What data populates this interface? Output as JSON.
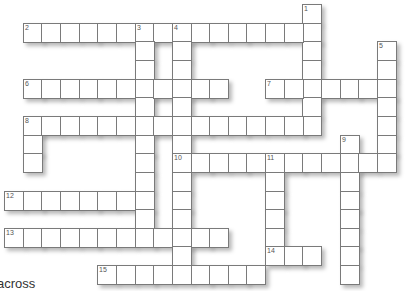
{
  "puzzle": {
    "type": "crossword",
    "heading": "across",
    "words": [
      {
        "number": "1",
        "direction": "down",
        "row": 0,
        "col": 16,
        "length": 7
      },
      {
        "number": "2",
        "direction": "across",
        "row": 1,
        "col": 1,
        "length": 16
      },
      {
        "number": "3",
        "direction": "down",
        "row": 1,
        "col": 7,
        "length": 12
      },
      {
        "number": "4",
        "direction": "down",
        "row": 1,
        "col": 9,
        "length": 14
      },
      {
        "number": "5",
        "direction": "down",
        "row": 2,
        "col": 20,
        "length": 7
      },
      {
        "number": "6",
        "direction": "across",
        "row": 4,
        "col": 1,
        "length": 11
      },
      {
        "number": "7",
        "direction": "across",
        "row": 4,
        "col": 14,
        "length": 7
      },
      {
        "number": "8",
        "direction": "across",
        "row": 6,
        "col": 1,
        "length": 16
      },
      {
        "number": "",
        "direction": "down",
        "row": 6,
        "col": 1,
        "length": 3
      },
      {
        "number": "9",
        "direction": "down",
        "row": 7,
        "col": 18,
        "length": 8
      },
      {
        "number": "10",
        "direction": "across",
        "row": 8,
        "col": 9,
        "length": 11
      },
      {
        "number": "11",
        "direction": "down",
        "row": 8,
        "col": 14,
        "length": 6
      },
      {
        "number": "12",
        "direction": "across",
        "row": 10,
        "col": 0,
        "length": 8
      },
      {
        "number": "13",
        "direction": "across",
        "row": 12,
        "col": 0,
        "length": 12
      },
      {
        "number": "14",
        "direction": "across",
        "row": 13,
        "col": 14,
        "length": 3
      },
      {
        "number": "15",
        "direction": "across",
        "row": 14,
        "col": 5,
        "length": 9
      }
    ]
  }
}
